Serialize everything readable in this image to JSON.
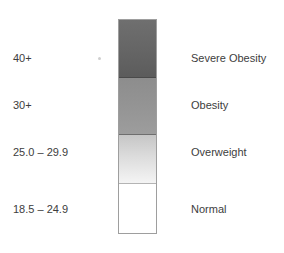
{
  "figure": {
    "background_color": "#ffffff",
    "width": 284,
    "height": 253
  },
  "scale_bar": {
    "border_color": "#9e9e9e",
    "segments": [
      {
        "key": "severe_obesity",
        "range_label": "40+",
        "category_label": "Severe Obesity",
        "color_top": "#6f6f6f",
        "color_bottom": "#5c5c5c"
      },
      {
        "key": "obesity",
        "range_label": "30+",
        "category_label": "Obesity",
        "color_top": "#8d8d8d",
        "color_bottom": "#9d9d9d"
      },
      {
        "key": "overweight",
        "range_label": "25.0 – 29.9",
        "category_label": "Overweight",
        "color_top": "#c6c6c6",
        "color_bottom": "#f4f4f4"
      },
      {
        "key": "normal",
        "range_label": "18.5 – 24.9",
        "category_label": "Normal",
        "color_top": "#ffffff",
        "color_bottom": "#ffffff"
      }
    ]
  },
  "chart_data": {
    "type": "heatmap",
    "title": "",
    "xlabel": "",
    "ylabel": "",
    "grid": false,
    "legend_position": "none",
    "orientation": "vertical",
    "categories": [
      "Severe Obesity",
      "Obesity",
      "Overweight",
      "Normal"
    ],
    "tick_labels": [
      "40+",
      "30+",
      "25.0 – 29.9",
      "18.5 – 24.9"
    ],
    "values": [
      40,
      30,
      27.45,
      21.7
    ],
    "bins": [
      {
        "label": "Severe Obesity",
        "range": "40+",
        "min": 40.0,
        "max": null,
        "color": "#656565"
      },
      {
        "label": "Obesity",
        "range": "30+",
        "min": 30.0,
        "max": 39.9,
        "color": "#949494"
      },
      {
        "label": "Overweight",
        "range": "25.0 – 29.9",
        "min": 25.0,
        "max": 29.9,
        "color": "#dcdcdc"
      },
      {
        "label": "Normal",
        "range": "18.5 – 24.9",
        "min": 18.5,
        "max": 24.9,
        "color": "#ffffff"
      }
    ],
    "colors": [
      "#656565",
      "#949494",
      "#dcdcdc",
      "#ffffff"
    ]
  }
}
